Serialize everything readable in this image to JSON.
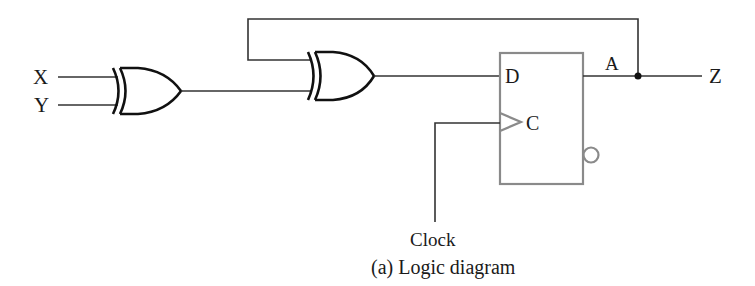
{
  "diagram": {
    "caption": "(a) Logic diagram",
    "inputs": {
      "x_label": "X",
      "y_label": "Y",
      "clock_label": "Clock"
    },
    "gates": [
      {
        "id": "xor1",
        "type": "XOR",
        "inputs": [
          "X",
          "Y"
        ]
      },
      {
        "id": "xor2",
        "type": "XOR",
        "inputs": [
          "A (feedback)",
          "xor1 output"
        ]
      }
    ],
    "flip_flop": {
      "type": "D flip-flop",
      "d_label": "D",
      "clock_label": "C",
      "output_label": "A",
      "has_inverted_output": true
    },
    "output": {
      "label": "Z"
    },
    "colors": {
      "gate_stroke": "#111111",
      "wire": "#333333",
      "flip_flop_box": "#8a8a8a",
      "background": "#ffffff"
    }
  }
}
